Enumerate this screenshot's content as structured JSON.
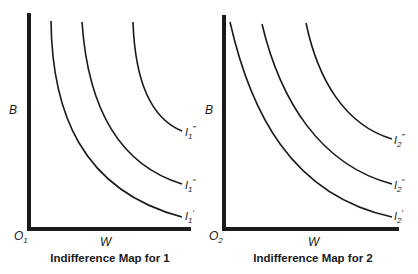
{
  "panels": [
    {
      "title": "Indifference Map for 1",
      "y_axis_label": "B",
      "x_axis_label": "W",
      "origin_label": "O",
      "origin_subscript": "1",
      "curves": [
        {
          "name": "I",
          "subscript": "1",
          "primes": "′",
          "level": 1
        },
        {
          "name": "I",
          "subscript": "1",
          "primes": "″",
          "level": 2
        },
        {
          "name": "I",
          "subscript": "1",
          "primes": "‴",
          "level": 3
        }
      ]
    },
    {
      "title": "Indifference Map for 2",
      "y_axis_label": "B",
      "x_axis_label": "W",
      "origin_label": "O",
      "origin_subscript": "2",
      "curves": [
        {
          "name": "I",
          "subscript": "2",
          "primes": "′",
          "level": 1
        },
        {
          "name": "I",
          "subscript": "2",
          "primes": "″",
          "level": 2
        },
        {
          "name": "I",
          "subscript": "2",
          "primes": "‴",
          "level": 3
        }
      ]
    }
  ]
}
